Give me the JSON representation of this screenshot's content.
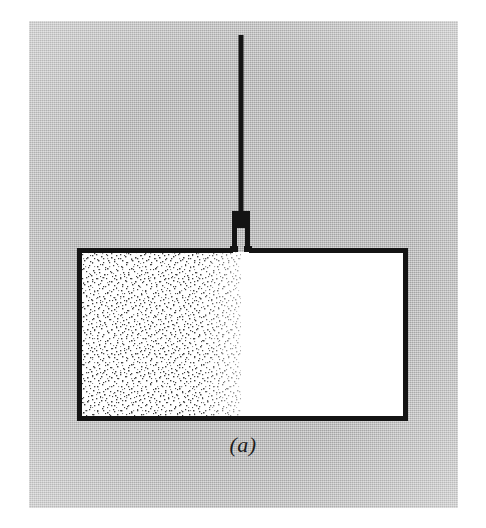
{
  "figure": {
    "caption": "(a)",
    "panel": {
      "background_color": "#b7b7b7",
      "page_color": "#ffffff",
      "left": 29,
      "top": 21,
      "width": 429,
      "height": 487
    },
    "ink_color": "#141414",
    "container": {
      "name": "rigid-insulated-container",
      "left": 77,
      "top": 249,
      "right": 408,
      "bottom": 421,
      "border_width": 5,
      "interior_color": "#ffffff"
    },
    "compartments": [
      {
        "name": "gas-compartment",
        "label": "",
        "fill": "stipple",
        "side": "left",
        "x": 80,
        "y": 252,
        "width": 161,
        "height": 166,
        "stipple_color": "#2a2a2a",
        "stipple_density": "medium"
      },
      {
        "name": "vacuum-compartment",
        "label": "",
        "fill": "white",
        "side": "right",
        "x": 241,
        "y": 252,
        "width": 164,
        "height": 166
      }
    ],
    "stem": {
      "name": "suspension-rod",
      "x": 241,
      "top": 35,
      "bottom": 213,
      "width": 5
    },
    "valve": {
      "name": "stopcock-valve",
      "center_x": 241,
      "top": 211,
      "bottom": 252,
      "body_width": 17,
      "body_height": 17,
      "leg_width": 5,
      "leg_gap": 5
    }
  }
}
